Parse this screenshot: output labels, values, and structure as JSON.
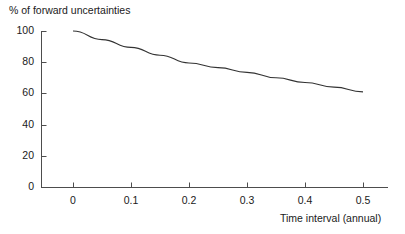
{
  "chart_data": {
    "type": "line",
    "title": "",
    "ylabel": "% of forward uncertainties",
    "xlabel": "Time interval (annual)",
    "xlim": [
      -0.03,
      0.545
    ],
    "ylim": [
      0,
      100
    ],
    "grid": false,
    "legend": null,
    "xticks": [
      0,
      0.1,
      0.2,
      0.3,
      0.4,
      0.5
    ],
    "xtick_labels": [
      "0",
      "0.1",
      "0.2",
      "0.3",
      "0.4",
      "0.5"
    ],
    "yticks": [
      0,
      20,
      40,
      60,
      80,
      100
    ],
    "ytick_labels": [
      "0",
      "20",
      "40",
      "60",
      "80",
      "100"
    ],
    "series": [
      {
        "name": "% of forward uncertainties",
        "color": "#333333",
        "x": [
          0.0,
          0.05,
          0.1,
          0.15,
          0.2,
          0.25,
          0.3,
          0.35,
          0.4,
          0.45,
          0.5
        ],
        "values": [
          100.0,
          94.5,
          89.5,
          84.5,
          79.5,
          76.5,
          73.5,
          70.0,
          67.0,
          64.0,
          61.0
        ]
      }
    ]
  },
  "axes": {
    "y_axis_title": "% of forward uncertainties",
    "x_axis_title": "Time interval (annual)"
  }
}
